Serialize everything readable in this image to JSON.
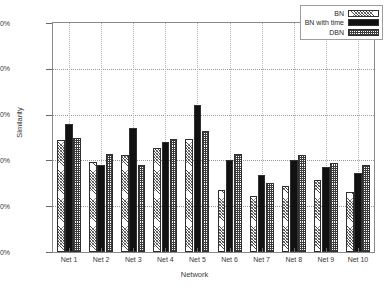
{
  "chart_data": {
    "type": "bar",
    "title": "",
    "xlabel": "Network",
    "ylabel": "Similarity",
    "categories": [
      "Net 1",
      "Net 2",
      "Net 3",
      "Net 4",
      "Net 5",
      "Net 6",
      "Net 7",
      "Net 8",
      "Net 9",
      "Net 10"
    ],
    "series": [
      {
        "name": "BN",
        "values": [
          49,
          39.5,
          42.5,
          45.5,
          49.5,
          27,
          24.5,
          29,
          31.5,
          26
        ]
      },
      {
        "name": "BN with time",
        "values": [
          56,
          38,
          54,
          48,
          64,
          40,
          33.5,
          40,
          37,
          34.5
        ]
      },
      {
        "name": "DBN",
        "values": [
          50,
          43,
          38,
          49.5,
          53,
          43,
          30,
          42.5,
          39,
          38
        ]
      }
    ],
    "ylim": [
      0,
      100
    ],
    "yticks": [
      "0%",
      "20%",
      "40%",
      "60%",
      "80%",
      "100%"
    ],
    "ytick_values": [
      0,
      20,
      40,
      60,
      80,
      100
    ],
    "grid": true,
    "legend_position": "top-right"
  },
  "legend": {
    "entries": [
      {
        "label": "BN",
        "pattern": "light-hatch"
      },
      {
        "label": "BN with time",
        "pattern": "solid-black"
      },
      {
        "label": "DBN",
        "pattern": "dense-checker"
      }
    ]
  },
  "colors": {
    "series_bn": "#ffffff",
    "series_bn_with_time": "#111111",
    "series_dbn": "#ffffff",
    "outline": "#303030",
    "grid": "#9a9a9a",
    "axis": "#8a8a8a",
    "text": "#2b2b2b"
  }
}
